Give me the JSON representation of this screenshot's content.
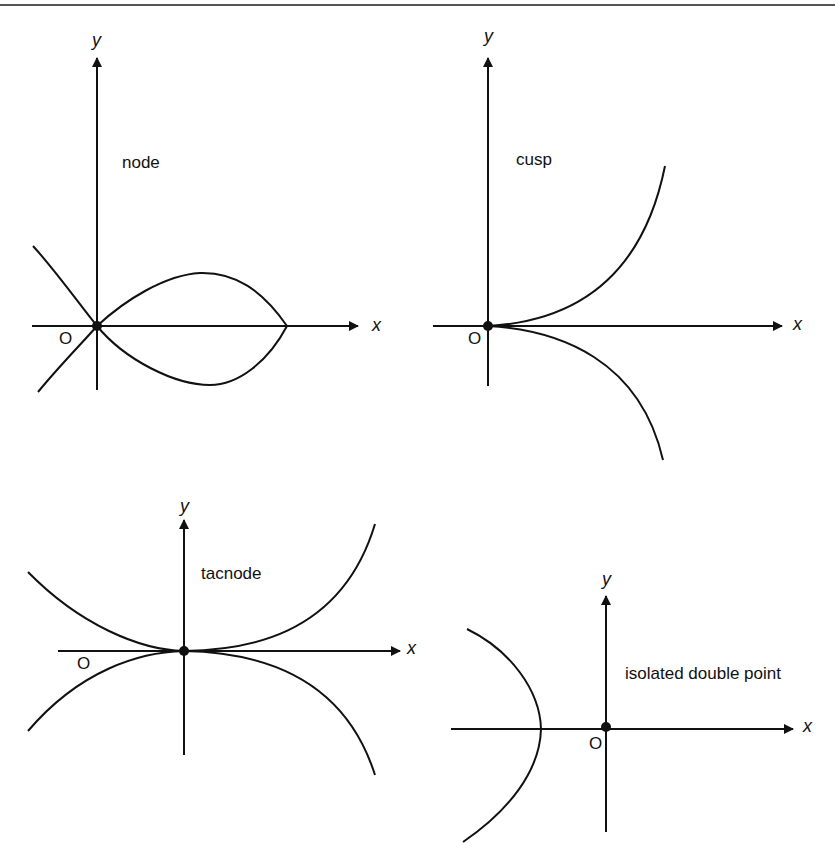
{
  "figure": {
    "panels": [
      {
        "id": "node",
        "label": "node",
        "origin_label": "O",
        "x_axis_label": "x",
        "y_axis_label": "y"
      },
      {
        "id": "cusp",
        "label": "cusp",
        "origin_label": "O",
        "x_axis_label": "x",
        "y_axis_label": "y"
      },
      {
        "id": "tacnode",
        "label": "tacnode",
        "origin_label": "O",
        "x_axis_label": "x",
        "y_axis_label": "y"
      },
      {
        "id": "isolated",
        "label": "isolated double point",
        "origin_label": "O",
        "x_axis_label": "x",
        "y_axis_label": "y"
      }
    ]
  },
  "colors": {
    "ink": "#111111",
    "background": "#ffffff",
    "rule": "#555555"
  }
}
